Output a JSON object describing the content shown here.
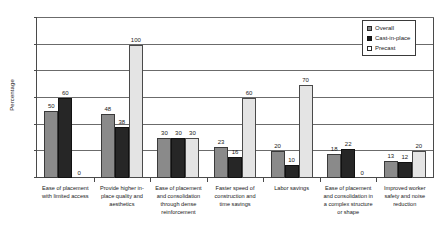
{
  "chart_data": {
    "type": "bar",
    "title": "",
    "xlabel": "",
    "ylabel": "Percentage",
    "ylim": [
      0,
      120
    ],
    "yticks": [
      0,
      20,
      40,
      60,
      80,
      100,
      120
    ],
    "grid": true,
    "legend_position": "top-right",
    "categories": [
      "Ease of placement with limited access",
      "Provide higher in-place quality and aesthetics",
      "Ease of placement and consolidation through dense reinforcement",
      "Faster speed of construction and time savings",
      "Labor savings",
      "Ease of placement and consolidation in a complex structure or shape",
      "Improved worker safety and noise reduction"
    ],
    "series": [
      {
        "name": "Overall",
        "color": "#8a8a8a",
        "values": [
          50,
          48,
          30,
          23,
          20,
          18,
          13
        ]
      },
      {
        "name": "Cast-in-place",
        "color": "#262626",
        "values": [
          60,
          38,
          30,
          16,
          10,
          22,
          12
        ]
      },
      {
        "name": "Precast",
        "color": "#e4e4e4",
        "values": [
          0,
          100,
          30,
          60,
          70,
          0,
          20
        ]
      }
    ]
  },
  "legend": {
    "items": [
      {
        "label": "Overall"
      },
      {
        "label": "Cast-in-place"
      },
      {
        "label": "Precast"
      }
    ]
  }
}
